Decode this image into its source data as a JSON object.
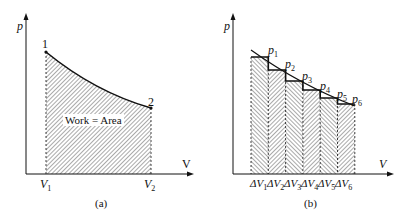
{
  "panel_a": {
    "y_axis_label": "p",
    "x_axis_label": "V",
    "point_1_label": "1",
    "point_2_label": "2",
    "v1_label": "V",
    "v1_sub": "1",
    "v2_label": "V",
    "v2_sub": "2",
    "area_label": "Work = Area",
    "caption": "(a)"
  },
  "panel_b": {
    "y_axis_label": "p",
    "x_axis_label": "V",
    "pressures": [
      {
        "label": "p",
        "sub": "1"
      },
      {
        "label": "p",
        "sub": "2"
      },
      {
        "label": "p",
        "sub": "3"
      },
      {
        "label": "p",
        "sub": "4"
      },
      {
        "label": "p",
        "sub": "5"
      },
      {
        "label": "p",
        "sub": "6"
      }
    ],
    "deltas": [
      {
        "label": "ΔV",
        "sub": "1"
      },
      {
        "label": "ΔV",
        "sub": "2"
      },
      {
        "label": "ΔV",
        "sub": "3"
      },
      {
        "label": "ΔV",
        "sub": "4"
      },
      {
        "label": "ΔV",
        "sub": "5"
      },
      {
        "label": "ΔV",
        "sub": "6"
      }
    ],
    "caption": "(b)"
  }
}
